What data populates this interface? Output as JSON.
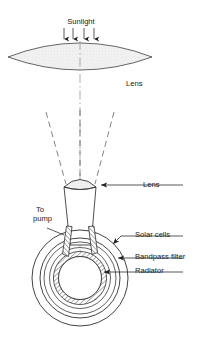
{
  "figure": {
    "title_present": false,
    "background_color": "#ffffff",
    "line_color": "#2e2e2e",
    "lens_fill_color": "#efefef",
    "hatch_color": "#2e2e2e"
  },
  "labels": {
    "sunlight": "Sunlight",
    "lens_top": "Lens",
    "lens_bottom": "Lens",
    "to_pump_line1": "To",
    "to_pump_line2": "pump",
    "solar_cells": "Solar cells",
    "bandpass_filter": "Bandpass filter",
    "radiator": "Radiator"
  },
  "icons": {
    "sunlight_arrows": "down-arrow-icon",
    "leader_arrow": "left-arrow-icon"
  },
  "components": {
    "primary_lens": {
      "name": "Lens",
      "shape": "biconvex-lens",
      "center_x": 80,
      "center_y": 55,
      "half_width": 72,
      "half_height": 14
    },
    "secondary_lens": {
      "name": "Lens",
      "shape": "plano-convex-cap",
      "center_x": 80,
      "center_y": 186,
      "half_width": 16
    },
    "cone": {
      "name": "tapering light guide",
      "top_half_width": 16,
      "bottom_half_width": 10,
      "top_y": 188,
      "bottom_y": 245
    },
    "sphere_assembly": {
      "center_x": 80,
      "center_y": 278,
      "radii": [
        48,
        40,
        36,
        29,
        25,
        22
      ]
    }
  },
  "ray_paths": {
    "count": 3,
    "description": "converging dashed rays from primary lens to secondary lens"
  }
}
